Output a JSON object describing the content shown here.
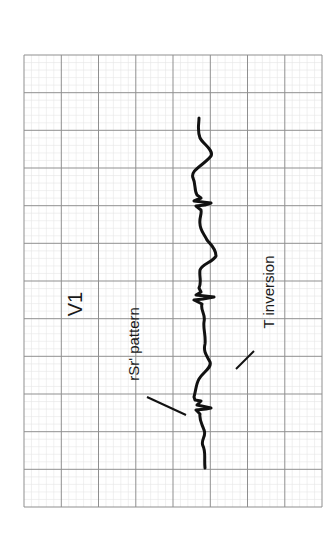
{
  "figure": {
    "lead": "V1",
    "annotations": [
      {
        "label": "rSr' pattern",
        "target": "rSr' complex"
      },
      {
        "label": "T inversion",
        "target": "inverted T wave"
      }
    ],
    "orientation": "rotated 90° counter-clockwise",
    "grid": {
      "major_columns": 8,
      "major_rows": 12,
      "major_line_color": "#8a8a8a",
      "minor_line_color": "#e2e2e2"
    },
    "trace_color": "#111111"
  }
}
